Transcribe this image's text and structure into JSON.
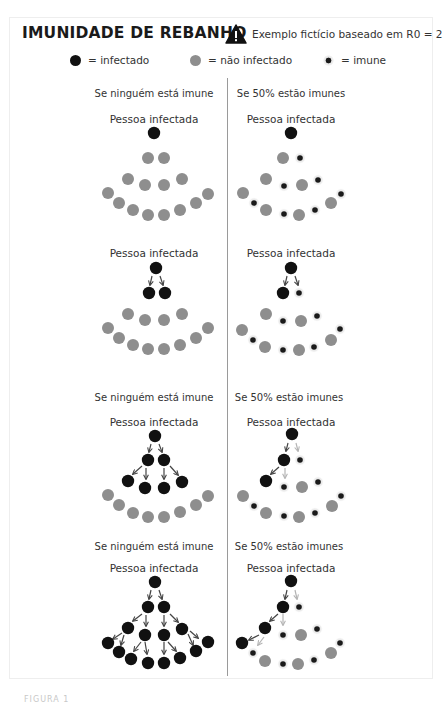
{
  "header": {
    "title": "IMUNIDADE DE REBANHO",
    "warning_icon": "warning-triangle-icon",
    "note": "Exemplo fictício baseado em R0 = 2"
  },
  "legend": [
    {
      "symbol": "infected-dot",
      "label": "= infectado"
    },
    {
      "symbol": "non-infected-dot",
      "label": "= não infectado"
    },
    {
      "symbol": "immune-dot",
      "label": "= imune"
    }
  ],
  "colors": {
    "infected": "#111111",
    "not_infected": "#8e8e8e",
    "immune_core": "#1a1a1a",
    "immune_halo": "#e6e6e6",
    "arrow_active": "#444444",
    "arrow_blocked": "#b4b4b4",
    "divider": "#9a9a9a"
  },
  "columns": {
    "left_heading": "Se ninguém está imune",
    "right_heading": "Se 50% estão imunes"
  },
  "panels": [
    {
      "headings": {
        "left": {
          "text": "Se ninguém está imune",
          "x": 154,
          "y": 88
        },
        "right": {
          "text": "Se 50% estão imunes",
          "x": 291,
          "y": 88
        }
      },
      "subtitle": "Pessoa infectada",
      "subtitle_y": 113,
      "left": {
        "nodes": [
          [
            154,
            133,
            "i"
          ],
          [
            148,
            158,
            "n"
          ],
          [
            164,
            158,
            "n"
          ],
          [
            128,
            179,
            "n"
          ],
          [
            145,
            185,
            "n"
          ],
          [
            164,
            185,
            "n"
          ],
          [
            182,
            179,
            "n"
          ],
          [
            108,
            193,
            "n"
          ],
          [
            119,
            203,
            "n"
          ],
          [
            133,
            210,
            "n"
          ],
          [
            148,
            215,
            "n"
          ],
          [
            164,
            215,
            "n"
          ],
          [
            180,
            210,
            "n"
          ],
          [
            196,
            203,
            "n"
          ],
          [
            208,
            194,
            "n"
          ]
        ],
        "arrows": []
      },
      "right": {
        "nodes": [
          [
            291,
            133,
            "i"
          ],
          [
            283,
            158,
            "n"
          ],
          [
            300,
            158,
            "m"
          ],
          [
            266,
            179,
            "n"
          ],
          [
            284,
            186,
            "m"
          ],
          [
            302,
            185,
            "n"
          ],
          [
            318,
            180,
            "m"
          ],
          [
            243,
            193,
            "n"
          ],
          [
            254,
            203,
            "m"
          ],
          [
            266,
            210,
            "n"
          ],
          [
            284,
            214,
            "m"
          ],
          [
            299,
            215,
            "n"
          ],
          [
            315,
            210,
            "m"
          ],
          [
            331,
            203,
            "n"
          ],
          [
            341,
            194,
            "m"
          ]
        ],
        "arrows": []
      }
    },
    {
      "headings": null,
      "subtitle": "Pessoa infectada",
      "subtitle_y": 247,
      "left": {
        "nodes": [
          [
            156,
            268,
            "i"
          ],
          [
            149,
            293,
            "i"
          ],
          [
            165,
            293,
            "i"
          ],
          [
            128,
            314,
            "n"
          ],
          [
            145,
            320,
            "n"
          ],
          [
            164,
            320,
            "n"
          ],
          [
            182,
            314,
            "n"
          ],
          [
            108,
            328,
            "n"
          ],
          [
            119,
            338,
            "n"
          ],
          [
            133,
            345,
            "n"
          ],
          [
            148,
            349,
            "n"
          ],
          [
            164,
            349,
            "n"
          ],
          [
            180,
            345,
            "n"
          ],
          [
            196,
            338,
            "n"
          ],
          [
            208,
            328,
            "n"
          ]
        ],
        "arrows": [
          [
            152,
            276,
            150,
            285,
            "a"
          ],
          [
            160,
            276,
            163,
            285,
            "a"
          ]
        ]
      },
      "right": {
        "nodes": [
          [
            291,
            268,
            "i"
          ],
          [
            283,
            293,
            "i"
          ],
          [
            299,
            293,
            "m"
          ],
          [
            266,
            314,
            "n"
          ],
          [
            283,
            321,
            "m"
          ],
          [
            301,
            321,
            "n"
          ],
          [
            317,
            316,
            "m"
          ],
          [
            242,
            330,
            "n"
          ],
          [
            253,
            340,
            "m"
          ],
          [
            265,
            347,
            "n"
          ],
          [
            283,
            350,
            "m"
          ],
          [
            299,
            350,
            "n"
          ],
          [
            314,
            347,
            "m"
          ],
          [
            331,
            340,
            "n"
          ],
          [
            340,
            329,
            "m"
          ]
        ],
        "arrows": [
          [
            287,
            276,
            285,
            285,
            "a"
          ],
          [
            295,
            276,
            298,
            285,
            "a"
          ]
        ]
      }
    },
    {
      "headings": {
        "left": {
          "text": "Se ninguém está imune",
          "x": 154,
          "y": 392
        },
        "right": {
          "text": "Se 50% estão imunes",
          "x": 289,
          "y": 392
        }
      },
      "subtitle": "Pessoa infectada",
      "subtitle_y": 416,
      "left": {
        "nodes": [
          [
            155,
            436,
            "i"
          ],
          [
            148,
            460,
            "i"
          ],
          [
            164,
            460,
            "i"
          ],
          [
            128,
            481,
            "i"
          ],
          [
            145,
            488,
            "i"
          ],
          [
            164,
            488,
            "i"
          ],
          [
            182,
            482,
            "i"
          ],
          [
            108,
            495,
            "n"
          ],
          [
            119,
            505,
            "n"
          ],
          [
            133,
            513,
            "n"
          ],
          [
            148,
            517,
            "n"
          ],
          [
            164,
            517,
            "n"
          ],
          [
            180,
            512,
            "n"
          ],
          [
            196,
            505,
            "n"
          ],
          [
            208,
            496,
            "n"
          ]
        ],
        "arrows": [
          [
            151,
            444,
            149,
            452,
            "a"
          ],
          [
            159,
            444,
            162,
            452,
            "a"
          ],
          [
            142,
            466,
            133,
            474,
            "a"
          ],
          [
            146,
            468,
            146,
            479,
            "a"
          ],
          [
            164,
            468,
            164,
            479,
            "a"
          ],
          [
            170,
            466,
            178,
            475,
            "a"
          ]
        ]
      },
      "right": {
        "nodes": [
          [
            292,
            434,
            "i"
          ],
          [
            284,
            460,
            "i"
          ],
          [
            300,
            460,
            "m"
          ],
          [
            266,
            481,
            "i"
          ],
          [
            284,
            487,
            "m"
          ],
          [
            302,
            487,
            "n"
          ],
          [
            318,
            482,
            "m"
          ],
          [
            243,
            496,
            "n"
          ],
          [
            254,
            506,
            "m"
          ],
          [
            266,
            513,
            "n"
          ],
          [
            284,
            516,
            "m"
          ],
          [
            299,
            517,
            "n"
          ],
          [
            315,
            513,
            "m"
          ],
          [
            332,
            506,
            "n"
          ],
          [
            341,
            496,
            "m"
          ]
        ],
        "arrows": [
          [
            288,
            443,
            286,
            451,
            "a"
          ],
          [
            296,
            443,
            298,
            451,
            "b"
          ],
          [
            279,
            467,
            271,
            474,
            "a"
          ],
          [
            285,
            468,
            285,
            478,
            "b"
          ]
        ]
      }
    },
    {
      "headings": {
        "left": {
          "text": "Se ninguém está imune",
          "x": 154,
          "y": 541
        },
        "right": {
          "text": "Se 50% estão imunes",
          "x": 289,
          "y": 541
        }
      },
      "subtitle": "Pessoa infectada",
      "subtitle_y": 562,
      "left": {
        "nodes": [
          [
            155,
            582,
            "i"
          ],
          [
            148,
            607,
            "i"
          ],
          [
            164,
            607,
            "i"
          ],
          [
            128,
            628,
            "i"
          ],
          [
            145,
            635,
            "i"
          ],
          [
            164,
            635,
            "i"
          ],
          [
            182,
            629,
            "i"
          ],
          [
            108,
            643,
            "i"
          ],
          [
            119,
            652,
            "i"
          ],
          [
            131,
            659,
            "i"
          ],
          [
            148,
            663,
            "i"
          ],
          [
            164,
            663,
            "i"
          ],
          [
            180,
            658,
            "i"
          ],
          [
            196,
            651,
            "i"
          ],
          [
            208,
            642,
            "i"
          ]
        ],
        "arrows": [
          [
            151,
            590,
            149,
            599,
            "a"
          ],
          [
            159,
            590,
            162,
            599,
            "a"
          ],
          [
            142,
            614,
            133,
            621,
            "a"
          ],
          [
            146,
            615,
            146,
            626,
            "a"
          ],
          [
            164,
            615,
            164,
            626,
            "a"
          ],
          [
            170,
            614,
            178,
            622,
            "a"
          ],
          [
            122,
            633,
            113,
            639,
            "a"
          ],
          [
            124,
            635,
            121,
            645,
            "a"
          ],
          [
            141,
            642,
            134,
            651,
            "a"
          ],
          [
            145,
            642,
            147,
            654,
            "a"
          ],
          [
            164,
            642,
            164,
            654,
            "a"
          ],
          [
            168,
            642,
            176,
            651,
            "a"
          ],
          [
            190,
            631,
            198,
            638,
            "a"
          ],
          [
            188,
            634,
            193,
            645,
            "a"
          ]
        ]
      },
      "right": {
        "nodes": [
          [
            291,
            581,
            "i"
          ],
          [
            283,
            607,
            "i"
          ],
          [
            299,
            607,
            "m"
          ],
          [
            265,
            628,
            "i"
          ],
          [
            283,
            635,
            "m"
          ],
          [
            301,
            635,
            "n"
          ],
          [
            317,
            629,
            "m"
          ],
          [
            242,
            643,
            "i"
          ],
          [
            253,
            653,
            "m"
          ],
          [
            265,
            661,
            "n"
          ],
          [
            283,
            664,
            "m"
          ],
          [
            298,
            664,
            "n"
          ],
          [
            314,
            660,
            "m"
          ],
          [
            331,
            653,
            "n"
          ],
          [
            340,
            643,
            "m"
          ]
        ],
        "arrows": [
          [
            287,
            590,
            285,
            599,
            "a"
          ],
          [
            295,
            590,
            297,
            599,
            "b"
          ],
          [
            278,
            614,
            270,
            621,
            "a"
          ],
          [
            283,
            614,
            283,
            625,
            "b"
          ],
          [
            259,
            635,
            249,
            640,
            "a"
          ],
          [
            264,
            637,
            258,
            645,
            "b"
          ]
        ]
      }
    }
  ],
  "caption": "FIGURA 1"
}
